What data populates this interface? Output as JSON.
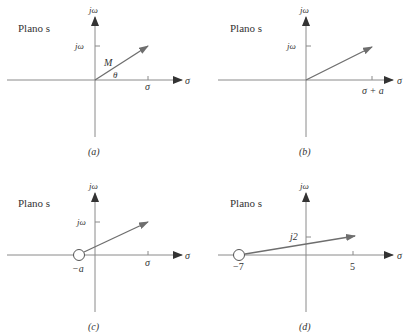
{
  "figure": {
    "panels": [
      {
        "id": "a",
        "caption": "(a)",
        "plane_label": "Plano s",
        "y_axis_label": "jω",
        "x_axis_label": "σ",
        "y_tick_label": "jω",
        "x_tick_label": "σ",
        "magnitude_label": "M",
        "angle_label": "θ"
      },
      {
        "id": "b",
        "caption": "(b)",
        "plane_label": "Plano s",
        "y_axis_label": "jω",
        "x_axis_label": "σ",
        "y_tick_label": "jω",
        "x_tick_label": "σ + a"
      },
      {
        "id": "c",
        "caption": "(c)",
        "plane_label": "Plano s",
        "y_axis_label": "jω",
        "x_axis_label": "σ",
        "y_tick_label": "jω",
        "x_tick_label": "σ",
        "zero_label": "−a"
      },
      {
        "id": "d",
        "caption": "(d)",
        "plane_label": "Plano s",
        "y_axis_label": "jω",
        "x_axis_label": "σ",
        "y_tick_label": "j2",
        "x_tick_label": "5",
        "zero_label": "−7"
      }
    ],
    "colors": {
      "axis": "#8a8a8a",
      "vector": "#6e6e6e",
      "text": "#333333"
    }
  }
}
